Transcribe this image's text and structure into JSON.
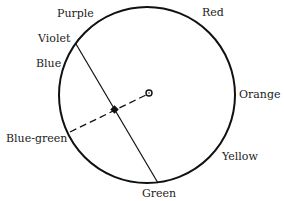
{
  "diagram": {
    "type": "color-circle",
    "labels": {
      "purple": "Purple",
      "red": "Red",
      "violet": "Violet",
      "blue": "Blue",
      "orange": "Orange",
      "blue_green": "Blue-green",
      "yellow": "Yellow",
      "green": "Green"
    },
    "colors": {
      "stroke": "#111111",
      "text": "#222222",
      "background": "#ffffff"
    }
  }
}
